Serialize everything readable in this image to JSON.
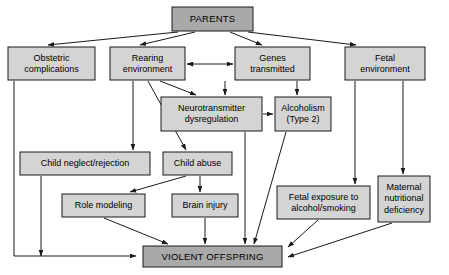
{
  "diagram": {
    "colors": {
      "node_fill_light": "#d4d4d4",
      "node_fill_dark": "#a9a9a9",
      "stroke": "#1a1a1a",
      "background": "#ffffff"
    },
    "nodes": [
      {
        "id": "parents",
        "label": "PARENTS",
        "lines": [
          "PARENTS"
        ],
        "x": 172,
        "y": 7,
        "w": 81,
        "h": 24,
        "shade": "dark"
      },
      {
        "id": "obstetric",
        "label": "Obstetric complications",
        "lines": [
          "Obstetric",
          "complications"
        ],
        "x": 8,
        "y": 47,
        "w": 87,
        "h": 33,
        "shade": "light"
      },
      {
        "id": "rearing",
        "label": "Rearing environment",
        "lines": [
          "Rearing",
          "environment"
        ],
        "x": 110,
        "y": 47,
        "w": 75,
        "h": 33,
        "shade": "light"
      },
      {
        "id": "genes",
        "label": "Genes transmitted",
        "lines": [
          "Genes",
          "transmitted"
        ],
        "x": 235,
        "y": 47,
        "w": 75,
        "h": 33,
        "shade": "light"
      },
      {
        "id": "fetalenv",
        "label": "Fetal environment",
        "lines": [
          "Fetal",
          "environment"
        ],
        "x": 345,
        "y": 47,
        "w": 80,
        "h": 33,
        "shade": "light"
      },
      {
        "id": "neurotrans",
        "label": "Neurotransmitter dysregulation",
        "lines": [
          "Neurotransmitter",
          "dysregulation"
        ],
        "x": 161,
        "y": 97,
        "w": 101,
        "h": 34,
        "shade": "light"
      },
      {
        "id": "alcoholism",
        "label": "Alcoholism (Type 2)",
        "lines": [
          "Alcoholism",
          "(Type 2)"
        ],
        "x": 275,
        "y": 97,
        "w": 56,
        "h": 34,
        "shade": "light"
      },
      {
        "id": "neglect",
        "label": "Child neglect/rejection",
        "lines": [
          "Child neglect/rejection"
        ],
        "x": 20,
        "y": 152,
        "w": 130,
        "h": 23,
        "shade": "light"
      },
      {
        "id": "abuse",
        "label": "Child abuse",
        "lines": [
          "Child abuse"
        ],
        "x": 163,
        "y": 152,
        "w": 69,
        "h": 23,
        "shade": "light"
      },
      {
        "id": "rolemodel",
        "label": "Role modeling",
        "lines": [
          "Role modeling"
        ],
        "x": 62,
        "y": 194,
        "w": 83,
        "h": 23,
        "shade": "light"
      },
      {
        "id": "braininjury",
        "label": "Brain injury",
        "lines": [
          "Brain injury"
        ],
        "x": 172,
        "y": 194,
        "w": 66,
        "h": 23,
        "shade": "light"
      },
      {
        "id": "fetalexposure",
        "label": "Fetal exposure to alcohol/smoking",
        "lines": [
          "Fetal exposure to",
          "alcohol/smoking"
        ],
        "x": 277,
        "y": 186,
        "w": 93,
        "h": 33,
        "shade": "light"
      },
      {
        "id": "maternal",
        "label": "Maternal nutritional deficiency",
        "lines": [
          "Maternal",
          "nutritional",
          "deficiency"
        ],
        "x": 378,
        "y": 176,
        "w": 52,
        "h": 46,
        "shade": "light"
      },
      {
        "id": "violent",
        "label": "VIOLENT OFFSPRING",
        "lines": [
          "VIOLENT OFFSPRING"
        ],
        "x": 143,
        "y": 246,
        "w": 139,
        "h": 21,
        "shade": "dark"
      }
    ],
    "edges": [
      {
        "from": "parents",
        "to": "obstetric",
        "kind": "arrow"
      },
      {
        "from": "parents",
        "to": "rearing",
        "kind": "arrow"
      },
      {
        "from": "parents",
        "to": "genes",
        "kind": "arrow"
      },
      {
        "from": "parents",
        "to": "fetalenv",
        "kind": "arrow"
      },
      {
        "from": "rearing",
        "to": "genes",
        "kind": "double-arrow"
      },
      {
        "from": "rearing",
        "to": "neurotrans",
        "kind": "arrow"
      },
      {
        "from": "rearing",
        "to": "neglect",
        "kind": "arrow"
      },
      {
        "from": "rearing",
        "to": "abuse",
        "kind": "arrow"
      },
      {
        "from": "genes",
        "to": "neurotrans",
        "kind": "arrow"
      },
      {
        "from": "genes",
        "to": "alcoholism",
        "kind": "arrow"
      },
      {
        "from": "neurotrans",
        "to": "alcoholism",
        "kind": "arrow"
      },
      {
        "from": "neurotrans",
        "to": "violent",
        "kind": "arrow"
      },
      {
        "from": "alcoholism",
        "to": "violent",
        "kind": "arrow"
      },
      {
        "from": "obstetric",
        "to": "violent",
        "kind": "arrow"
      },
      {
        "from": "neglect",
        "to": "violent",
        "kind": "arrow"
      },
      {
        "from": "abuse",
        "to": "rolemodel",
        "kind": "arrow"
      },
      {
        "from": "abuse",
        "to": "braininjury",
        "kind": "arrow"
      },
      {
        "from": "rolemodel",
        "to": "violent",
        "kind": "arrow"
      },
      {
        "from": "braininjury",
        "to": "violent",
        "kind": "arrow"
      },
      {
        "from": "fetalenv",
        "to": "fetalexposure",
        "kind": "arrow"
      },
      {
        "from": "fetalenv",
        "to": "maternal",
        "kind": "arrow"
      },
      {
        "from": "fetalexposure",
        "to": "violent",
        "kind": "arrow"
      },
      {
        "from": "maternal",
        "to": "violent",
        "kind": "arrow"
      }
    ]
  }
}
